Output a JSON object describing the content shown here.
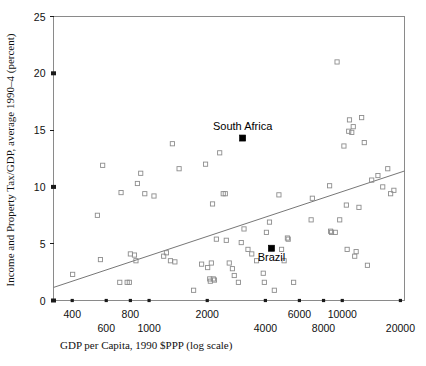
{
  "chart_data": {
    "type": "scatter",
    "title": "",
    "xlabel": "GDP per Capita, 1990 $PPP (log scale)",
    "ylabel": "Income and Property Tax/GDP, average 1990–4 (percent)",
    "xscale": "log",
    "yscale": "linear",
    "xlim": [
      320,
      21000
    ],
    "ylim": [
      0,
      25
    ],
    "grid": false,
    "legend": null,
    "y_ticks": [
      0,
      5,
      10,
      15,
      20,
      25
    ],
    "y_tick_labels": [
      "0",
      "5",
      "10",
      "15",
      "20",
      "25"
    ],
    "x_ticks": [
      400,
      600,
      800,
      1000,
      2000,
      4000,
      6000,
      8000,
      10000,
      20000
    ],
    "x_tick_labels_upper": [
      "400",
      "800",
      "2000",
      "6000",
      "10000"
    ],
    "x_tick_labels_lower": [
      "600",
      "1000",
      "4000",
      "8000",
      "20000"
    ],
    "x_tick_label_upper_values": [
      400,
      800,
      2000,
      6000,
      10000
    ],
    "x_tick_label_lower_values": [
      600,
      1000,
      4000,
      8000,
      20000
    ],
    "marker_style": "open-square",
    "trendline": {
      "style": "solid",
      "color": "#777777",
      "x_start": 320,
      "y_start": 1.15,
      "x_end": 21000,
      "y_end": 11.4
    },
    "annotations": [
      {
        "text": "South Africa",
        "x": 3050,
        "y": 14.3,
        "label_dy": -1.5,
        "highlight": true
      },
      {
        "text": "Brazil",
        "x": 4300,
        "y": 4.6,
        "label_dy": 1.6,
        "highlight": true
      }
    ],
    "series": [
      {
        "name": "Countries",
        "marker": "open-square",
        "points": [
          [
            402,
            2.3
          ],
          [
            540,
            7.5
          ],
          [
            560,
            3.6
          ],
          [
            575,
            11.9
          ],
          [
            705,
            1.6
          ],
          [
            716,
            9.5
          ],
          [
            770,
            1.6
          ],
          [
            790,
            1.6
          ],
          [
            800,
            4.1
          ],
          [
            840,
            4.0
          ],
          [
            855,
            3.5
          ],
          [
            870,
            10.3
          ],
          [
            905,
            11.2
          ],
          [
            950,
            9.4
          ],
          [
            1060,
            9.2
          ],
          [
            1190,
            3.9
          ],
          [
            1230,
            4.2
          ],
          [
            1290,
            3.5
          ],
          [
            1320,
            13.8
          ],
          [
            1360,
            3.4
          ],
          [
            1430,
            11.6
          ],
          [
            1700,
            0.9
          ],
          [
            1870,
            3.2
          ],
          [
            1960,
            12.0
          ],
          [
            2010,
            2.9
          ],
          [
            2060,
            1.9
          ],
          [
            2075,
            1.7
          ],
          [
            2100,
            3.3
          ],
          [
            2130,
            8.5
          ],
          [
            2150,
            1.9
          ],
          [
            2180,
            1.8
          ],
          [
            2230,
            5.4
          ],
          [
            2320,
            13.0
          ],
          [
            2420,
            9.4
          ],
          [
            2480,
            9.4
          ],
          [
            2510,
            5.3
          ],
          [
            2600,
            3.3
          ],
          [
            2700,
            2.8
          ],
          [
            2760,
            2.2
          ],
          [
            2900,
            1.6
          ],
          [
            3000,
            5.1
          ],
          [
            3100,
            6.3
          ],
          [
            3250,
            4.5
          ],
          [
            3400,
            4.1
          ],
          [
            3600,
            3.5
          ],
          [
            3900,
            2.4
          ],
          [
            3950,
            1.6
          ],
          [
            4050,
            6.0
          ],
          [
            4200,
            6.9
          ],
          [
            4450,
            0.9
          ],
          [
            4700,
            9.3
          ],
          [
            4850,
            4.5
          ],
          [
            5000,
            3.5
          ],
          [
            5200,
            5.5
          ],
          [
            5250,
            5.4
          ],
          [
            5600,
            1.6
          ],
          [
            6900,
            7.1
          ],
          [
            7000,
            9.0
          ],
          [
            8600,
            10.1
          ],
          [
            8700,
            6.1
          ],
          [
            8800,
            6.0
          ],
          [
            9200,
            6.0
          ],
          [
            9400,
            21.0
          ],
          [
            9700,
            7.1
          ],
          [
            10200,
            13.6
          ],
          [
            10500,
            8.4
          ],
          [
            10600,
            4.5
          ],
          [
            10800,
            14.9
          ],
          [
            10900,
            15.9
          ],
          [
            11200,
            14.8
          ],
          [
            11400,
            15.3
          ],
          [
            11600,
            3.9
          ],
          [
            11800,
            4.3
          ],
          [
            12200,
            8.2
          ],
          [
            12600,
            16.1
          ],
          [
            13000,
            13.9
          ],
          [
            13500,
            3.1
          ],
          [
            14200,
            10.6
          ],
          [
            15300,
            11.0
          ],
          [
            16200,
            10.0
          ],
          [
            17200,
            11.6
          ],
          [
            17800,
            9.4
          ],
          [
            18500,
            9.7
          ]
        ]
      }
    ]
  }
}
